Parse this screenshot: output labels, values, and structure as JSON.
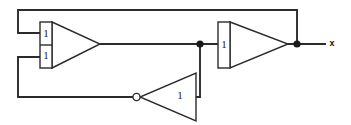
{
  "diagram": {
    "background_color": "#ffffff",
    "line_color": "#2b2b2b",
    "output_port": {
      "label": "x"
    },
    "gates": [
      {
        "id": "gate-or-left",
        "type": "or-gate",
        "symbol_standard": "IEC rectangle with triangle",
        "inputs": 2,
        "labels": [
          "1",
          "1"
        ],
        "orientation": "right"
      },
      {
        "id": "gate-buffer-right",
        "type": "buffer-gate",
        "symbol_standard": "IEC rectangle with triangle",
        "inputs": 1,
        "labels": [
          "1"
        ],
        "orientation": "right"
      },
      {
        "id": "gate-inverter-bottom",
        "type": "inverter-gate",
        "symbol_standard": "triangle with inversion bubble",
        "inputs": 1,
        "labels": [
          "1"
        ],
        "orientation": "left"
      }
    ],
    "junctions": [
      {
        "id": "junction-mid",
        "x": 200,
        "y": 44
      },
      {
        "id": "junction-out",
        "x": 297,
        "y": 44
      }
    ]
  }
}
